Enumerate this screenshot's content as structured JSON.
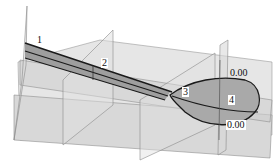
{
  "diagram": {
    "section_labels": [
      {
        "id": "1",
        "text": "1"
      },
      {
        "id": "2",
        "text": "2"
      },
      {
        "id": "3",
        "text": "3"
      },
      {
        "id": "4",
        "text": "4"
      }
    ],
    "dimension_labels": [
      {
        "id": "top",
        "text": "0.00"
      },
      {
        "id": "bottom",
        "text": "0.00"
      }
    ],
    "colors": {
      "plane_fill": "#d4d4d4",
      "plane_edge": "#8a8a8a",
      "surface_fill": "#a8a8a8",
      "curve": "#1a1a1a",
      "background": "#ffffff"
    }
  }
}
